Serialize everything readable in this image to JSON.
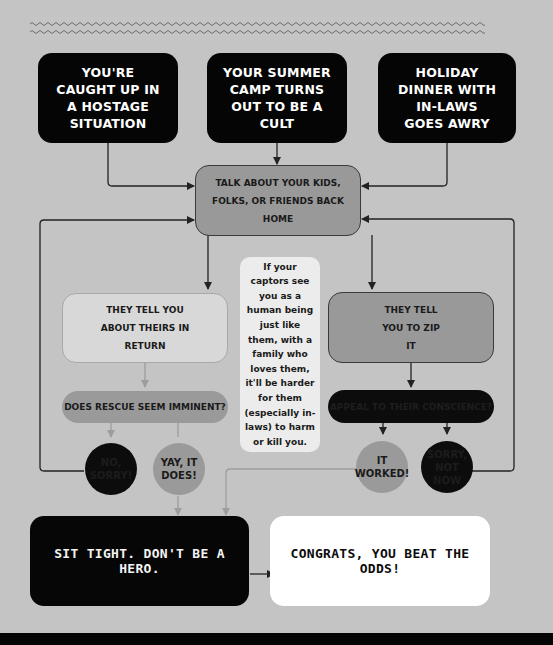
{
  "colors": {
    "background": "#c4c4c4",
    "black_box": "#050505",
    "mid_gray": "#999999",
    "light_gray": "#d8d8d8",
    "note_bg": "#ececec",
    "white_box": "#ffffff",
    "line_dark": "#222222",
    "line_light": "#9d9d9d"
  },
  "starts": [
    {
      "label": "YOU'RE CAUGHT UP IN A HOSTAGE SITUATION"
    },
    {
      "label": "YOUR SUMMER CAMP TURNS OUT TO BE A CULT"
    },
    {
      "label": "HOLIDAY DINNER WITH IN-LAWS GOES AWRY"
    }
  ],
  "central": {
    "label": "TALK ABOUT YOUR KIDS, FOLKS, OR FRIENDS BACK HOME"
  },
  "left_branch": {
    "box": "THEY TELL YOU ABOUT THEIRS IN RETURN",
    "question": "DOES RESCUE SEEM IMMINENT?",
    "no": "NO, SORRY!",
    "yes": "YAY, IT DOES!"
  },
  "right_branch": {
    "box": "THEY TELL YOU TO ZIP IT",
    "question": "APPEAL TO THEIR CONSCIENCE?",
    "yes": "IT WORKED!",
    "no": "SORRY, NOT NOW"
  },
  "note": {
    "text": "If your captors see you as a human being just like them, with a family who loves them, it'll be harder for them (especially in-laws) to harm or kill you."
  },
  "outcomes": {
    "sit_tight": "SIT TIGHT. DON'T BE A HERO.",
    "congrats": "CONGRATS, YOU BEAT THE ODDS!"
  }
}
